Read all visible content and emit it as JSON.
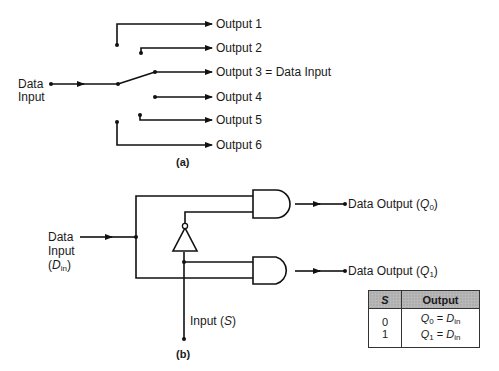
{
  "diagram_a": {
    "caption": "(a)",
    "input_label_line1": "Data",
    "input_label_line2": "Input",
    "outputs": [
      {
        "label": "Output 1"
      },
      {
        "label": "Output 2"
      },
      {
        "label": "Output 3 = Data Input"
      },
      {
        "label": "Output 4"
      },
      {
        "label": "Output 5"
      },
      {
        "label": "Output 6"
      }
    ]
  },
  "diagram_b": {
    "caption": "(b)",
    "input_label_line1": "Data",
    "input_label_line2": "Input",
    "input_label_line3_open": "(",
    "input_label_sym": "D",
    "input_label_sub": "in",
    "input_label_line3_close": ")",
    "select_label": "Input (",
    "select_sym": "S",
    "select_close": ")",
    "output0_prefix": "Data Output (",
    "output0_sym": "Q",
    "output0_sub": "0",
    "output1_prefix": "Data Output (",
    "output1_sym": "Q",
    "output1_sub": "1",
    "close_paren": ")"
  },
  "truth_table": {
    "headers": [
      "S",
      "Output"
    ],
    "rows": [
      {
        "s": "0",
        "q": "Q",
        "q_sub": "0",
        "eq": " = ",
        "d": "D",
        "d_sub": "in"
      },
      {
        "s": "1",
        "q": "Q",
        "q_sub": "1",
        "eq": " = ",
        "d": "D",
        "d_sub": "in"
      }
    ]
  }
}
